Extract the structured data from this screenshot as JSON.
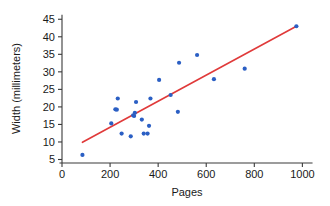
{
  "chart_data": {
    "type": "scatter",
    "title": "",
    "xlabel": "Pages",
    "ylabel": "Width (millimeters)",
    "xlim": [
      0,
      1040
    ],
    "ylim": [
      4,
      46.5
    ],
    "xticks": [
      0,
      200,
      400,
      600,
      800,
      1000
    ],
    "yticks": [
      5,
      10,
      15,
      20,
      25,
      30,
      35,
      40,
      45
    ],
    "grid": false,
    "legend": null,
    "point_color": "#2b5fc4",
    "trend_color": "#e03a3a",
    "points": [
      {
        "x": 85,
        "y": 6.3
      },
      {
        "x": 205,
        "y": 15.3
      },
      {
        "x": 222,
        "y": 19.3
      },
      {
        "x": 228,
        "y": 19.2
      },
      {
        "x": 232,
        "y": 22.4
      },
      {
        "x": 248,
        "y": 12.4
      },
      {
        "x": 286,
        "y": 11.6
      },
      {
        "x": 296,
        "y": 17.6
      },
      {
        "x": 300,
        "y": 17.4
      },
      {
        "x": 303,
        "y": 18.3
      },
      {
        "x": 308,
        "y": 21.4
      },
      {
        "x": 332,
        "y": 16.4
      },
      {
        "x": 340,
        "y": 12.4
      },
      {
        "x": 356,
        "y": 12.4
      },
      {
        "x": 362,
        "y": 14.6
      },
      {
        "x": 368,
        "y": 22.4
      },
      {
        "x": 404,
        "y": 27.7
      },
      {
        "x": 452,
        "y": 23.4
      },
      {
        "x": 482,
        "y": 18.6
      },
      {
        "x": 487,
        "y": 32.6
      },
      {
        "x": 562,
        "y": 34.8
      },
      {
        "x": 632,
        "y": 27.9
      },
      {
        "x": 760,
        "y": 30.9
      },
      {
        "x": 975,
        "y": 43.0
      }
    ],
    "trend_line": {
      "x_start": 85,
      "y_start": 9.9,
      "x_end": 975,
      "y_end": 43.0
    }
  }
}
